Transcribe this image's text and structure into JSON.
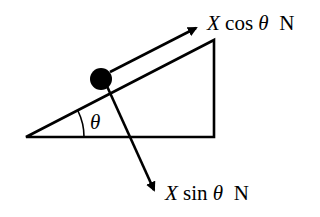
{
  "diagram": {
    "type": "inclined-plane-force-diagram",
    "angle_label": "θ",
    "forces": [
      {
        "id": "parallel",
        "var": "X",
        "func": "cos",
        "angle": "θ",
        "unit": "N",
        "direction": "up the slope"
      },
      {
        "id": "perpendicular",
        "var": "X",
        "func": "sin",
        "angle": "θ",
        "unit": "N",
        "direction": "into the slope"
      }
    ],
    "object": "particle (solid circle) on slope",
    "colors": {
      "stroke": "#000000",
      "background": "#ffffff"
    }
  }
}
